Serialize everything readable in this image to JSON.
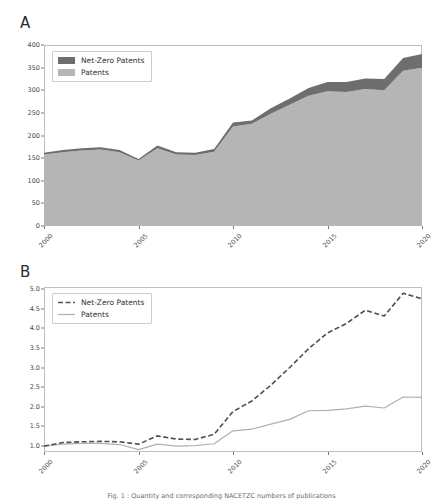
{
  "figure": {
    "background": "#ffffff",
    "caption": "Fig. 1 : Quantity and corresponding NACETZC numbers of publications"
  },
  "colors": {
    "net_zero_fill": "#6e6e6e",
    "patents_fill": "#b5b5b5",
    "net_zero_line": "#4f4f4f",
    "patents_line": "#b0b0b0",
    "frame": "#bfbfbf",
    "tick_text": "#4a4a4a"
  },
  "panel_a": {
    "label": "A",
    "legend": {
      "position": "upper-left",
      "entries": [
        {
          "label": "Net-Zero Patents",
          "marker": "filled-patch",
          "color": "#6e6e6e"
        },
        {
          "label": "Patents",
          "marker": "filled-patch",
          "color": "#b5b5b5"
        }
      ]
    }
  },
  "panel_b": {
    "label": "B",
    "legend": {
      "position": "upper-left",
      "entries": [
        {
          "label": "Net-Zero Patents",
          "marker": "dashed-line",
          "color": "#4f4f4f"
        },
        {
          "label": "Patents",
          "marker": "solid-line",
          "color": "#b0b0b0"
        }
      ]
    }
  },
  "chart_data": [
    {
      "type": "area",
      "id": "panel-a",
      "title": "A",
      "stacked": true,
      "xlabel": "",
      "ylabel": "",
      "x": [
        2000,
        2001,
        2002,
        2003,
        2004,
        2005,
        2006,
        2007,
        2008,
        2009,
        2010,
        2011,
        2012,
        2013,
        2014,
        2015,
        2016,
        2017,
        2018,
        2019,
        2020
      ],
      "xlim": [
        2000,
        2020
      ],
      "ylim": [
        0,
        400
      ],
      "xticks": [
        2000,
        2005,
        2010,
        2015,
        2020
      ],
      "xticklabels": [
        "2000",
        "2005",
        "2010",
        "2015",
        "2020"
      ],
      "yticks": [
        0,
        50,
        100,
        150,
        200,
        250,
        300,
        350,
        400
      ],
      "yticklabels": [
        "0",
        "50",
        "100",
        "150",
        "200",
        "250",
        "300",
        "350",
        "400"
      ],
      "grid": false,
      "series": [
        {
          "name": "Patents",
          "color": "#b5b5b5",
          "values": [
            158,
            163,
            167,
            169,
            163,
            145,
            172,
            158,
            157,
            164,
            220,
            226,
            248,
            268,
            288,
            298,
            296,
            303,
            300,
            343,
            350
          ]
        },
        {
          "name": "Net-Zero Patents",
          "color": "#6e6e6e",
          "values": [
            4,
            5,
            5,
            5,
            5,
            3,
            6,
            5,
            5,
            6,
            9,
            7,
            12,
            14,
            17,
            20,
            22,
            23,
            25,
            28,
            30
          ]
        }
      ],
      "totals": [
        162,
        168,
        172,
        174,
        168,
        148,
        178,
        163,
        162,
        170,
        229,
        233,
        260,
        282,
        305,
        318,
        318,
        326,
        325,
        371,
        380
      ]
    },
    {
      "type": "line",
      "id": "panel-b",
      "title": "B",
      "xlabel": "",
      "ylabel": "",
      "x": [
        2000,
        2001,
        2002,
        2003,
        2004,
        2005,
        2006,
        2007,
        2008,
        2009,
        2010,
        2011,
        2012,
        2013,
        2014,
        2015,
        2016,
        2017,
        2018,
        2019,
        2020
      ],
      "xlim": [
        2000,
        2020
      ],
      "ylim": [
        0.85,
        5.05
      ],
      "xticks": [
        2000,
        2005,
        2010,
        2015,
        2020
      ],
      "xticklabels": [
        "2000",
        "2005",
        "2010",
        "2015",
        "2020"
      ],
      "yticks": [
        1.0,
        1.5,
        2.0,
        2.5,
        3.0,
        3.5,
        4.0,
        4.5,
        5.0
      ],
      "yticklabels": [
        "1.0",
        "1.5",
        "2.0",
        "2.5",
        "3.0",
        "3.5",
        "4.0",
        "4.5",
        "5.0"
      ],
      "grid": false,
      "series": [
        {
          "name": "Net-Zero Patents",
          "color": "#4f4f4f",
          "style": "dashed",
          "values": [
            1.0,
            1.09,
            1.11,
            1.12,
            1.11,
            1.05,
            1.26,
            1.18,
            1.17,
            1.3,
            1.88,
            2.15,
            2.55,
            3.0,
            3.48,
            3.88,
            4.12,
            4.46,
            4.31,
            4.89,
            4.75
          ]
        },
        {
          "name": "Patents",
          "color": "#b0b0b0",
          "style": "solid",
          "values": [
            1.0,
            1.05,
            1.07,
            1.07,
            1.04,
            0.91,
            1.05,
            1.0,
            1.01,
            1.06,
            1.39,
            1.43,
            1.56,
            1.68,
            1.9,
            1.91,
            1.95,
            2.02,
            1.97,
            2.25,
            2.24
          ]
        }
      ]
    }
  ]
}
